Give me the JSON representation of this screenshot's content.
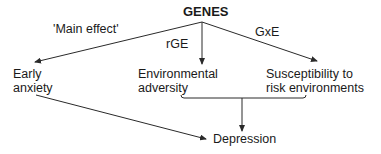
{
  "diagram": {
    "root": {
      "label": "GENES"
    },
    "edge_labels": {
      "main_effect": "'Main effect'",
      "rge": "rGE",
      "gxe": "GxE"
    },
    "nodes": {
      "early_anxiety": {
        "line1": "Early",
        "line2": "anxiety"
      },
      "environmental_adversity": {
        "line1": "Environmental",
        "line2": "adversity"
      },
      "susceptibility": {
        "line1": "Susceptibility to",
        "line2": "risk environments"
      },
      "depression": {
        "label": "Depression"
      }
    },
    "edges": [
      {
        "from": "GENES",
        "to": "Early anxiety",
        "label": "'Main effect'"
      },
      {
        "from": "GENES",
        "to": "Environmental adversity",
        "label": "rGE"
      },
      {
        "from": "GENES",
        "to": "Susceptibility to risk environments",
        "label": "GxE"
      },
      {
        "from": "Early anxiety",
        "to": "Depression",
        "label": ""
      },
      {
        "from": [
          "Environmental adversity",
          "Susceptibility to risk environments"
        ],
        "to": "Depression",
        "label": ""
      }
    ],
    "colors": {
      "line": "#2a2a2a",
      "text": "#1a1a1a",
      "background": "#ffffff"
    }
  }
}
